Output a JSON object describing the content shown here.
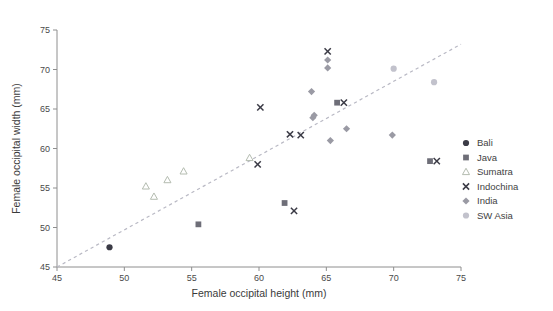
{
  "chart_data": {
    "type": "scatter",
    "title": "",
    "xlabel": "Female occipital height (mm)",
    "ylabel": "Female occipital width (mm)",
    "xlim": [
      45,
      75
    ],
    "ylim": [
      45,
      75
    ],
    "xticks": [
      45,
      50,
      55,
      60,
      65,
      70,
      75
    ],
    "yticks": [
      45,
      50,
      55,
      60,
      65,
      70,
      75
    ],
    "grid": false,
    "legend_position": "right",
    "trendline": {
      "name": "reference-line",
      "style": "dashed",
      "color": "#b9b9c4",
      "x": [
        45,
        75
      ],
      "y": [
        45,
        73.2
      ]
    },
    "series": [
      {
        "name": "Bali",
        "marker": "circle",
        "color": "#3b3b46",
        "points": [
          {
            "x": 48.9,
            "y": 47.5
          }
        ]
      },
      {
        "name": "Java",
        "marker": "square",
        "color": "#6e6e78",
        "points": [
          {
            "x": 55.5,
            "y": 50.4
          },
          {
            "x": 61.9,
            "y": 53.1
          },
          {
            "x": 65.8,
            "y": 65.8
          },
          {
            "x": 72.7,
            "y": 58.4
          }
        ]
      },
      {
        "name": "Sumatra",
        "marker": "triangle",
        "color": "#b4bcb0",
        "points": [
          {
            "x": 51.6,
            "y": 55.2
          },
          {
            "x": 53.2,
            "y": 56.0
          },
          {
            "x": 52.2,
            "y": 53.9
          },
          {
            "x": 54.4,
            "y": 57.1
          },
          {
            "x": 59.3,
            "y": 58.8
          }
        ]
      },
      {
        "name": "Indochina",
        "marker": "x",
        "color": "#3b3b46",
        "points": [
          {
            "x": 60.1,
            "y": 65.2
          },
          {
            "x": 59.9,
            "y": 58.0
          },
          {
            "x": 62.3,
            "y": 61.8
          },
          {
            "x": 63.1,
            "y": 61.7
          },
          {
            "x": 62.6,
            "y": 52.1
          },
          {
            "x": 65.1,
            "y": 72.3
          },
          {
            "x": 66.3,
            "y": 65.8
          },
          {
            "x": 73.2,
            "y": 58.4
          }
        ]
      },
      {
        "name": "India",
        "marker": "diamond",
        "color": "#9a9aa4",
        "points": [
          {
            "x": 65.1,
            "y": 71.2
          },
          {
            "x": 65.1,
            "y": 70.2
          },
          {
            "x": 63.9,
            "y": 67.2
          },
          {
            "x": 64.0,
            "y": 63.9
          },
          {
            "x": 64.1,
            "y": 64.2
          },
          {
            "x": 66.5,
            "y": 62.5
          },
          {
            "x": 65.3,
            "y": 61.0
          },
          {
            "x": 69.9,
            "y": 61.7
          }
        ]
      },
      {
        "name": "SW Asia",
        "marker": "circle-light",
        "color": "#c2c2cc",
        "points": [
          {
            "x": 70.0,
            "y": 70.1
          },
          {
            "x": 73.0,
            "y": 68.4
          }
        ]
      }
    ]
  },
  "legend": {
    "entries": [
      {
        "label": "Bali",
        "marker": "circle",
        "color": "#3b3b46"
      },
      {
        "label": "Java",
        "marker": "square",
        "color": "#6e6e78"
      },
      {
        "label": "Sumatra",
        "marker": "triangle",
        "color": "#b4bcb0"
      },
      {
        "label": "Indochina",
        "marker": "x",
        "color": "#3b3b46"
      },
      {
        "label": "India",
        "marker": "diamond",
        "color": "#9a9aa4"
      },
      {
        "label": "SW Asia",
        "marker": "circle-light",
        "color": "#c2c2cc"
      }
    ]
  }
}
